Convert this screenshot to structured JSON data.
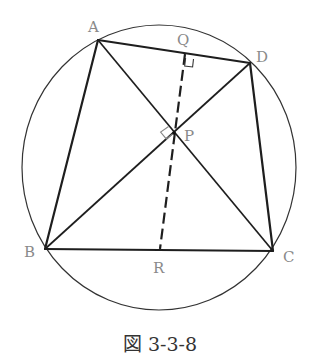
{
  "figure": {
    "caption": "図 3-3-8",
    "colors": {
      "line": "#222222",
      "label": "#8a8a8a",
      "background": "#ffffff"
    },
    "circle": {
      "cx": 159,
      "cy": 167.5,
      "rx": 137,
      "ry": 142.5
    },
    "points": {
      "A": {
        "label": "A",
        "x": 98,
        "y": 40
      },
      "B": {
        "label": "B",
        "x": 45,
        "y": 249
      },
      "C": {
        "label": "C",
        "x": 273,
        "y": 251
      },
      "D": {
        "label": "D",
        "x": 250,
        "y": 63
      },
      "P": {
        "label": "P",
        "x": 174,
        "y": 133
      },
      "Q": {
        "label": "Q",
        "x": 185,
        "y": 53
      },
      "R": {
        "label": "R",
        "x": 160,
        "y": 250
      }
    },
    "segments": {
      "sides": [
        "AB",
        "BC",
        "CD",
        "DA"
      ],
      "diagonals": [
        "AC",
        "BD"
      ],
      "dashed": [
        "QR"
      ]
    },
    "right_angles": [
      "at Q between QR and AD",
      "at P between AC and BD"
    ]
  }
}
